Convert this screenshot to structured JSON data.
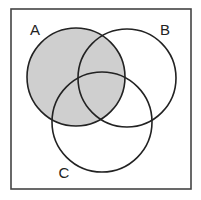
{
  "diagram": {
    "type": "venn",
    "sets": [
      {
        "id": "A",
        "label": "A",
        "cx": 76,
        "cy": 77,
        "r": 49,
        "label_x": 35,
        "label_y": 35
      },
      {
        "id": "B",
        "label": "B",
        "cx": 127,
        "cy": 78,
        "r": 49,
        "label_x": 165,
        "label_y": 35
      },
      {
        "id": "C",
        "label": "C",
        "cx": 102,
        "cy": 122,
        "r": 50,
        "label_x": 64,
        "label_y": 178
      }
    ],
    "shaded_region": "A",
    "universe_frame": {
      "x": 11,
      "y": 9,
      "width": 180,
      "height": 180
    },
    "colors": {
      "shade": "#cfcfcf",
      "stroke": "#222222",
      "frame": "#444444",
      "background": "#ffffff"
    }
  }
}
